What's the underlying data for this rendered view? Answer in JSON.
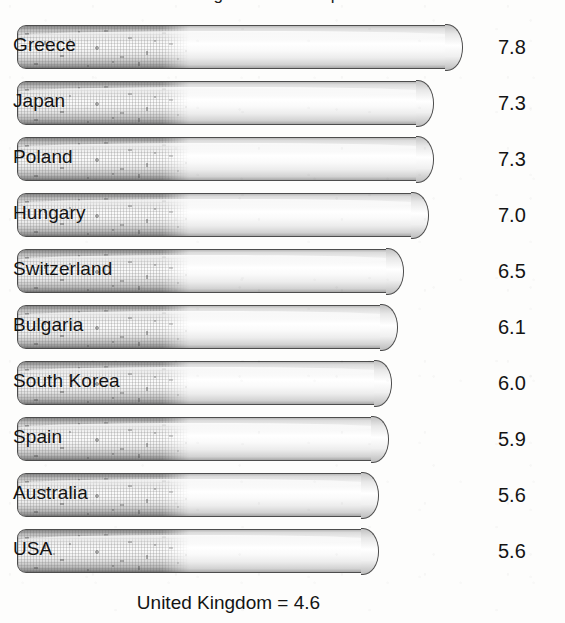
{
  "title": "Cigarette consumption",
  "footnote": "United Kingdom = 4.6",
  "chart_data": {
    "type": "bar",
    "title": "Cigarette consumption",
    "xlabel": "",
    "ylabel": "",
    "orientation": "horizontal",
    "grid": false,
    "legend": false,
    "note": "United Kingdom = 4.6",
    "categories": [
      "Greece",
      "Japan",
      "Poland",
      "Hungary",
      "Switzerland",
      "Bulgaria",
      "South Korea",
      "Spain",
      "Australia",
      "USA"
    ],
    "values": [
      7.8,
      7.3,
      7.3,
      7.0,
      6.5,
      6.1,
      6.0,
      5.9,
      5.6,
      5.6
    ],
    "value_labels": [
      "7.8",
      "7.3",
      "7.3",
      "7.0",
      "6.5",
      "6.1",
      "6.0",
      "5.9",
      "5.6",
      "5.6"
    ],
    "reference": {
      "label": "United Kingdom",
      "value": 4.6,
      "text": "United Kingdom = 4.6"
    }
  },
  "rows": [
    {
      "label": "Greece",
      "value": "7.8",
      "width": 445
    },
    {
      "label": "Japan",
      "value": "7.3",
      "width": 416
    },
    {
      "label": "Poland",
      "value": "7.3",
      "width": 416
    },
    {
      "label": "Hungary",
      "value": "7.0",
      "width": 411
    },
    {
      "label": "Switzerland",
      "value": "6.5",
      "width": 386
    },
    {
      "label": "Bulgaria",
      "value": "6.1",
      "width": 380
    },
    {
      "label": "South Korea",
      "value": "6.0",
      "width": 374
    },
    {
      "label": "Spain",
      "value": "5.9",
      "width": 371
    },
    {
      "label": "Australia",
      "value": "5.6",
      "width": 361
    },
    {
      "label": "USA",
      "value": "5.6",
      "width": 361
    }
  ],
  "colors": {
    "background": "#fdfdfc",
    "bar_outline": "#4d4d4d",
    "bar_paper": "#ffffff",
    "bar_filter": "#9a9a9a",
    "text": "#131313"
  }
}
